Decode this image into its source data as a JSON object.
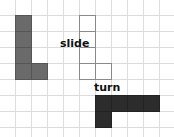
{
  "diagram": {
    "title": "",
    "grid": {
      "cell_size_px": 16,
      "origin_px": [
        15,
        15
      ],
      "line_color": "#dcdcdc"
    },
    "colors": {
      "original": "#6a6a6a",
      "slide_outline": "#8a8a8a",
      "turn": "#2c2c2c"
    },
    "labels": {
      "slide": "slide",
      "turn": "turn"
    },
    "shapes": [
      {
        "name": "original-l-shape",
        "style": "filled-grey",
        "cells": [
          [
            0,
            0
          ],
          [
            0,
            1
          ],
          [
            0,
            2
          ],
          [
            0,
            3
          ],
          [
            1,
            3
          ]
        ]
      },
      {
        "name": "slid-l-shape",
        "style": "outline",
        "cells": [
          [
            4,
            0
          ],
          [
            4,
            1
          ],
          [
            4,
            2
          ],
          [
            4,
            3
          ],
          [
            5,
            3
          ]
        ]
      },
      {
        "name": "turned-l-shape",
        "style": "filled-dark",
        "cells": [
          [
            5,
            5
          ],
          [
            6,
            5
          ],
          [
            7,
            5
          ],
          [
            8,
            5
          ],
          [
            5,
            6
          ]
        ]
      }
    ]
  }
}
